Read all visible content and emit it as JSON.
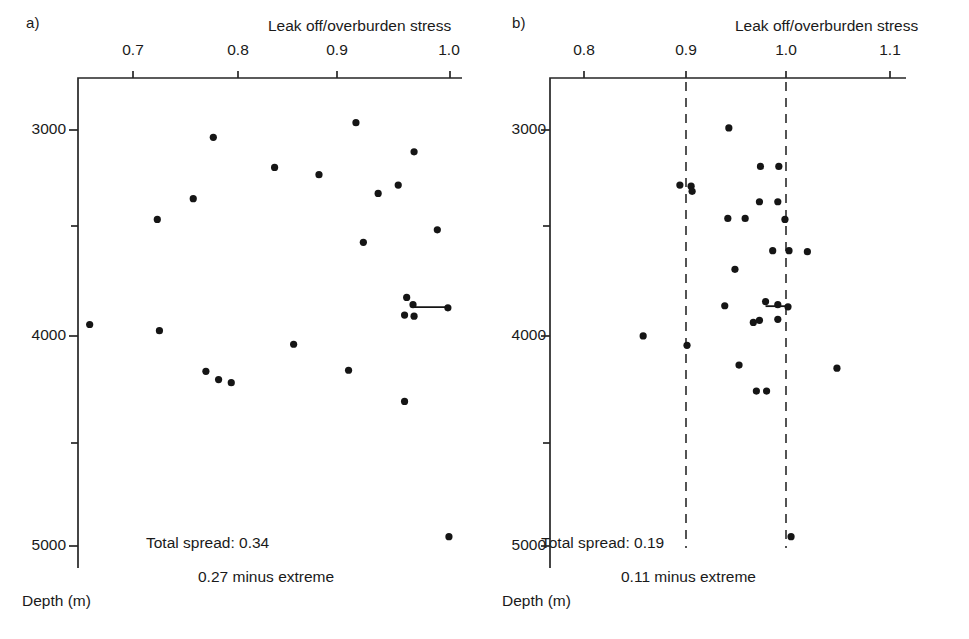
{
  "figure": {
    "background_color": "#ffffff",
    "ink_color": "#151515"
  },
  "panels": [
    {
      "key": "a",
      "label": "a)",
      "xaxis": {
        "title": "Leak off/overburden stress",
        "ticks": [
          0.7,
          0.8,
          0.9,
          1.0
        ],
        "tick_labels": [
          "0.7",
          "0.8",
          "0.9",
          "1.0"
        ],
        "range": [
          0.655,
          1.02
        ],
        "position": "top"
      },
      "yaxis": {
        "title": "Depth (m)",
        "ticks": [
          3000,
          4000,
          5000
        ],
        "tick_labels": [
          "3000",
          "4000",
          "5000"
        ],
        "minor_ticks": [
          3500,
          4500
        ],
        "range": [
          2800,
          5100
        ],
        "inverted": true
      },
      "annotations": [
        {
          "name": "total-spread",
          "text": "Total spread: 0.34"
        },
        {
          "name": "minus-extreme",
          "text": "0.27 minus extreme"
        }
      ],
      "reference_lines": [],
      "points": [
        {
          "x": 0.911,
          "y": 2965
        },
        {
          "x": 0.776,
          "y": 3035
        },
        {
          "x": 0.966,
          "y": 3105
        },
        {
          "x": 0.834,
          "y": 3180
        },
        {
          "x": 0.876,
          "y": 3215
        },
        {
          "x": 0.951,
          "y": 3265
        },
        {
          "x": 0.932,
          "y": 3305
        },
        {
          "x": 0.757,
          "y": 3330
        },
        {
          "x": 0.723,
          "y": 3430
        },
        {
          "x": 0.988,
          "y": 3480
        },
        {
          "x": 0.918,
          "y": 3540
        },
        {
          "x": 0.959,
          "y": 3805
        },
        {
          "x": 0.965,
          "y": 3840
        },
        {
          "x": 0.998,
          "y": 3855
        },
        {
          "x": 0.957,
          "y": 3890
        },
        {
          "x": 0.966,
          "y": 3895
        },
        {
          "x": 0.659,
          "y": 3935
        },
        {
          "x": 0.725,
          "y": 3965
        },
        {
          "x": 0.852,
          "y": 4030
        },
        {
          "x": 0.769,
          "y": 4160
        },
        {
          "x": 0.904,
          "y": 4155
        },
        {
          "x": 0.793,
          "y": 4215
        },
        {
          "x": 0.781,
          "y": 4200
        },
        {
          "x": 0.957,
          "y": 4305
        },
        {
          "x": 0.999,
          "y": 4955
        }
      ],
      "connectors": [
        {
          "x1": 0.965,
          "x2": 0.998,
          "y": 3852
        }
      ]
    },
    {
      "key": "b",
      "label": "b)",
      "xaxis": {
        "title": "Leak off/overburden stress",
        "ticks": [
          0.8,
          0.9,
          1.0,
          1.1
        ],
        "tick_labels": [
          "0.8",
          "0.9",
          "1.0",
          "1.1"
        ],
        "range": [
          0.765,
          1.12
        ],
        "position": "top"
      },
      "yaxis": {
        "title": "Depth (m)",
        "ticks": [
          3000,
          4000,
          5000
        ],
        "tick_labels": [
          "3000",
          "4000",
          "5000"
        ],
        "minor_ticks": [
          3500,
          4500
        ],
        "range": [
          2800,
          5100
        ],
        "inverted": true
      },
      "annotations": [
        {
          "name": "total-spread",
          "text": "Total spread: 0.19"
        },
        {
          "name": "minus-extreme",
          "text": "0.11 minus extreme"
        }
      ],
      "reference_lines": [
        {
          "x": 0.9,
          "style": "dashed"
        },
        {
          "x": 1.0,
          "style": "dashed"
        }
      ],
      "points": [
        {
          "x": 0.942,
          "y": 2990
        },
        {
          "x": 0.973,
          "y": 3175
        },
        {
          "x": 0.991,
          "y": 3175
        },
        {
          "x": 0.894,
          "y": 3265
        },
        {
          "x": 0.905,
          "y": 3270
        },
        {
          "x": 0.906,
          "y": 3295
        },
        {
          "x": 0.972,
          "y": 3345
        },
        {
          "x": 0.99,
          "y": 3345
        },
        {
          "x": 0.941,
          "y": 3425
        },
        {
          "x": 0.997,
          "y": 3430
        },
        {
          "x": 0.958,
          "y": 3425
        },
        {
          "x": 0.985,
          "y": 3580
        },
        {
          "x": 1.001,
          "y": 3580
        },
        {
          "x": 1.019,
          "y": 3585
        },
        {
          "x": 0.948,
          "y": 3670
        },
        {
          "x": 0.938,
          "y": 3845
        },
        {
          "x": 0.978,
          "y": 3825
        },
        {
          "x": 0.99,
          "y": 3840
        },
        {
          "x": 1.0,
          "y": 3850
        },
        {
          "x": 0.966,
          "y": 3925
        },
        {
          "x": 0.972,
          "y": 3915
        },
        {
          "x": 0.99,
          "y": 3910
        },
        {
          "x": 0.858,
          "y": 3990
        },
        {
          "x": 0.901,
          "y": 4035
        },
        {
          "x": 0.952,
          "y": 4130
        },
        {
          "x": 1.048,
          "y": 4145
        },
        {
          "x": 0.969,
          "y": 4255
        },
        {
          "x": 0.979,
          "y": 4255
        },
        {
          "x": 1.003,
          "y": 4955
        }
      ],
      "connectors": [
        {
          "x1": 0.978,
          "x2": 1.0,
          "y": 3847
        }
      ]
    }
  ]
}
